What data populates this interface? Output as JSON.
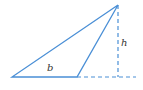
{
  "diagram": {
    "type": "triangle-base-height",
    "labels": {
      "base": "b",
      "height": "h"
    },
    "colors": {
      "stroke": "#4a8fd6",
      "label": "#333333",
      "background": "#ffffff"
    },
    "points": {
      "base_left": [
        12,
        77
      ],
      "base_right": [
        77,
        77
      ],
      "apex": [
        118,
        5
      ],
      "foot": [
        118,
        77
      ],
      "extension_end": [
        136,
        77
      ]
    }
  }
}
